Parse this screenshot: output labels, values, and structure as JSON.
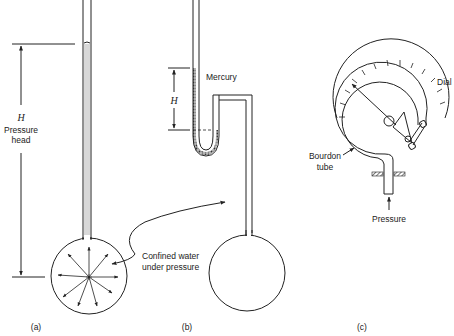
{
  "figure": {
    "panels": [
      {
        "id": "a",
        "caption": "(a)",
        "labels": {
          "height_symbol": "H",
          "height_label_line1": "Pressure",
          "height_label_line2": "head"
        }
      },
      {
        "id": "b",
        "caption": "(b)",
        "labels": {
          "height_symbol": "H",
          "fluid_label": "Mercury"
        }
      },
      {
        "id": "c",
        "caption": "(c)",
        "labels": {
          "dial_label": "Dial",
          "tube_label_line1": "Bourdon",
          "tube_label_line2": "tube",
          "pressure_label": "Pressure"
        }
      }
    ],
    "shared_callout": {
      "line1": "Confined water",
      "line2": "under pressure"
    },
    "colors": {
      "ink": "#222222",
      "mercury_fill": "#888888",
      "background": "#ffffff"
    }
  }
}
